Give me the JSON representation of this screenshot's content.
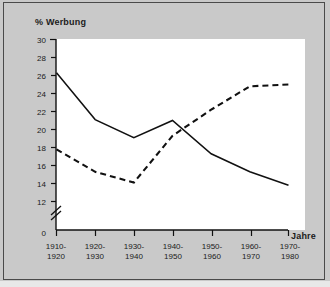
{
  "figure": {
    "background_color": "#c9c9c9",
    "plot_background_color": "#ffffff",
    "border_color": "#4a4a4a",
    "line_color": "#111111"
  },
  "chart_data": {
    "type": "line",
    "title": "",
    "ylabel": "% Werbung",
    "xlabel": "Jahre",
    "categories": [
      "1910-\n1920",
      "1920-\n1930",
      "1930-\n1940",
      "1940-\n1950",
      "1950-\n1960",
      "1960-\n1970",
      "1970-\n1980"
    ],
    "category_lines": [
      [
        "1910-",
        "1920"
      ],
      [
        "1920-",
        "1930"
      ],
      [
        "1930-",
        "1940"
      ],
      [
        "1940-",
        "1950"
      ],
      [
        "1950-",
        "1960"
      ],
      [
        "1960-",
        "1970"
      ],
      [
        "1970-",
        "1980"
      ]
    ],
    "ylim": [
      12,
      30
    ],
    "y_axis_break": true,
    "y_break_base": 0,
    "yticks": [
      30,
      28,
      26,
      24,
      22,
      20,
      18,
      16,
      14,
      12,
      0
    ],
    "ytick_labels": [
      "30",
      "28",
      "26",
      "24",
      "22",
      "20",
      "18",
      "16",
      "14",
      "12",
      "0"
    ],
    "grid": false,
    "legend_position": "inline-annotation",
    "series": [
      {
        "name": "rational",
        "style": "solid",
        "label_text": "rational",
        "values": [
          26.3,
          21.1,
          19.1,
          21.0,
          17.3,
          15.3,
          13.8
        ]
      },
      {
        "name": "sensual",
        "style": "dashed",
        "label_text": "„sensual“",
        "values": [
          17.8,
          15.3,
          14.1,
          19.3,
          22.2,
          24.8,
          25.0
        ]
      }
    ]
  }
}
